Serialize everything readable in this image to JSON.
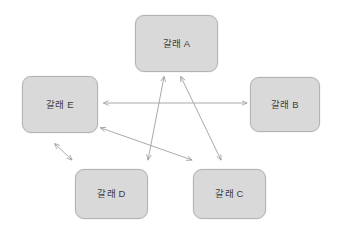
{
  "diagram": {
    "type": "node-link-diagram",
    "background_color": "#ffffff",
    "node_fill_color": "#d9d9d9",
    "node_border_color": "#b3b3b3",
    "edge_color": "#a0a0a0",
    "label_color": "#3d3d3d",
    "nodes": [
      {
        "id": "a",
        "label": "갈래 A",
        "x": 135,
        "y": 15,
        "w": 83,
        "h": 57
      },
      {
        "id": "b",
        "label": "갈래 B",
        "x": 250,
        "y": 77,
        "w": 70,
        "h": 55
      },
      {
        "id": "c",
        "label": "갈래 C",
        "x": 193,
        "y": 169,
        "w": 73,
        "h": 50
      },
      {
        "id": "d",
        "label": "갈래 D",
        "x": 75,
        "y": 169,
        "w": 73,
        "h": 50
      },
      {
        "id": "e",
        "label": "갈래 E",
        "x": 22,
        "y": 76,
        "w": 76,
        "h": 57
      }
    ],
    "edges": [
      {
        "id": "edge-e-b",
        "from": "e",
        "to": "b",
        "arrowheads": "both",
        "x1": 104,
        "y1": 103,
        "x2": 247,
        "y2": 103
      },
      {
        "id": "edge-a-d",
        "from": "a",
        "to": "d",
        "arrowheads": "both",
        "x1": 164,
        "y1": 77,
        "x2": 148,
        "y2": 160
      },
      {
        "id": "edge-a-c",
        "from": "a",
        "to": "c",
        "arrowheads": "both",
        "x1": 181,
        "y1": 77,
        "x2": 221,
        "y2": 160
      },
      {
        "id": "edge-e-c",
        "from": "e",
        "to": "c",
        "arrowheads": "both",
        "x1": 101,
        "y1": 128,
        "x2": 192,
        "y2": 160
      },
      {
        "id": "edge-e-d",
        "from": "e",
        "to": "d",
        "arrowheads": "both",
        "x1": 55,
        "y1": 144,
        "x2": 72,
        "y2": 160
      }
    ]
  }
}
